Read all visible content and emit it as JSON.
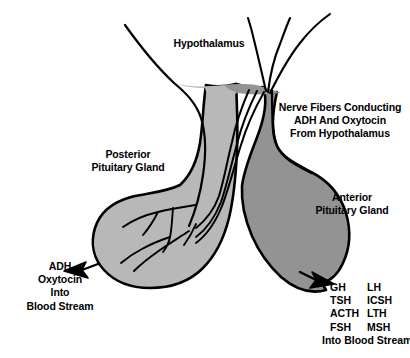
{
  "figure": {
    "background_color": "#ffffff",
    "outline_color": "#000000",
    "posterior_lobe_color": "#b8b8b8",
    "anterior_lobe_color": "#939393"
  },
  "labels": {
    "hypothalamus": "Hypothalamus",
    "nerve_fibers": "Nerve Fibers Conducting\nADH And Oxytocin\nFrom Hypothalamus",
    "posterior_pituitary": "Posterior\nPituitary Gland",
    "anterior_pituitary": "Anterior\nPituitary Gland",
    "posterior_output": "ADH\nOxytocin\nInto\nBlood Stream"
  },
  "anterior_hormones": {
    "column_left": [
      "GH",
      "TSH",
      "ACTH",
      "FSH"
    ],
    "column_right": [
      "LH",
      "ICSH",
      "LTH",
      "MSH"
    ],
    "footer": "Into Blood Stream"
  },
  "structures": {
    "nerve_fiber_count_external": 3,
    "arrows": [
      "posterior-output-arrow",
      "anterior-output-arrow"
    ]
  }
}
